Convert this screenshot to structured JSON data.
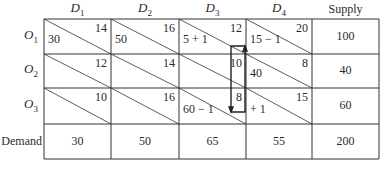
{
  "table": {
    "columns": [
      {
        "label": "D",
        "sub": "1"
      },
      {
        "label": "D",
        "sub": "2"
      },
      {
        "label": "D",
        "sub": "3"
      },
      {
        "label": "D",
        "sub": "4"
      }
    ],
    "supply_header": "Supply",
    "demand_label": "Demand",
    "rows": [
      {
        "label": "O",
        "sub": "1",
        "cells": [
          {
            "cost": "14",
            "alloc": "30"
          },
          {
            "cost": "16",
            "alloc": "50"
          },
          {
            "cost": "12",
            "alloc": "5 + 1"
          },
          {
            "cost": "20",
            "alloc": "15 − 1"
          }
        ],
        "supply": "100"
      },
      {
        "label": "O",
        "sub": "2",
        "cells": [
          {
            "cost": "12",
            "alloc": ""
          },
          {
            "cost": "14",
            "alloc": ""
          },
          {
            "cost": "10",
            "alloc": ""
          },
          {
            "cost": "8",
            "alloc": "40"
          }
        ],
        "supply": "40"
      },
      {
        "label": "O",
        "sub": "3",
        "cells": [
          {
            "cost": "10",
            "alloc": ""
          },
          {
            "cost": "16",
            "alloc": ""
          },
          {
            "cost": "8",
            "alloc": "60 − 1"
          },
          {
            "cost": "15",
            "alloc": "+ 1"
          }
        ],
        "supply": "60"
      }
    ],
    "demand": [
      "30",
      "50",
      "65",
      "55"
    ],
    "total": "200"
  }
}
